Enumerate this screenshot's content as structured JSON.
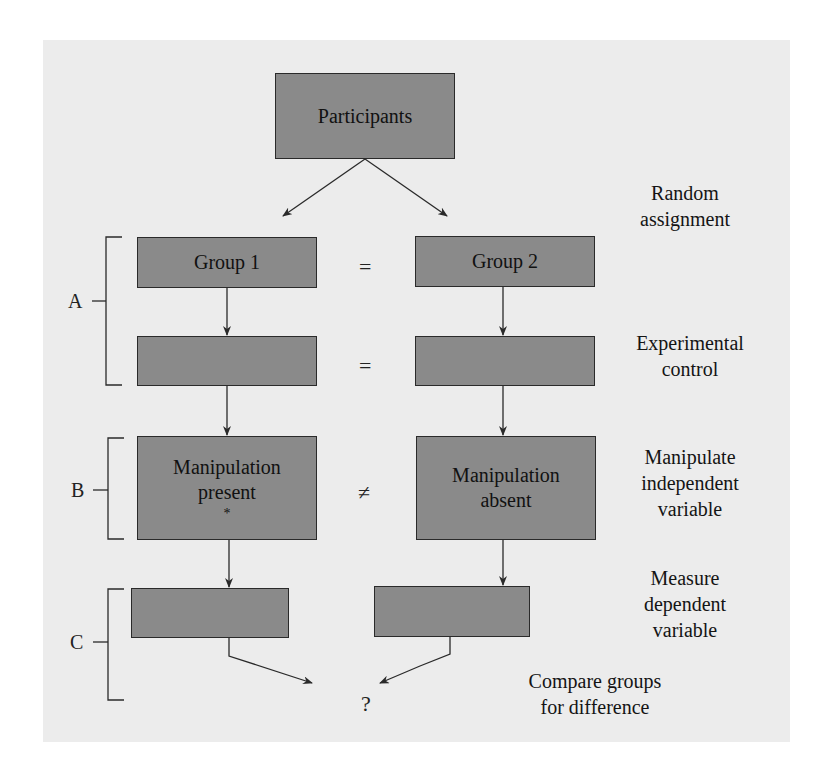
{
  "diagram": {
    "title_box": "Participants",
    "boxes": {
      "group1": "Group 1",
      "group2": "Group 2",
      "control_left": "",
      "control_right": "",
      "manip_present_line1": "Manipulation",
      "manip_present_line2": "present",
      "manip_present_mark": "*",
      "manip_absent_line1": "Manipulation",
      "manip_absent_line2": "absent",
      "measure_left": "",
      "measure_right": ""
    },
    "relations": {
      "row1": "=",
      "row2": "=",
      "row3": "≠",
      "result": "?"
    },
    "brackets": [
      "A",
      "B",
      "C"
    ],
    "step_labels": {
      "random_assignment": [
        "Random",
        "assignment"
      ],
      "experimental_control": [
        "Experimental",
        "control"
      ],
      "manipulate_iv": [
        "Manipulate",
        "independent",
        "variable"
      ],
      "measure_dv": [
        "Measure",
        "dependent",
        "variable"
      ],
      "compare": [
        "Compare groups",
        "for difference"
      ]
    },
    "colors": {
      "panel": "#ececec",
      "box_fill": "#8a8a8a",
      "line": "#2a2a2a"
    }
  }
}
